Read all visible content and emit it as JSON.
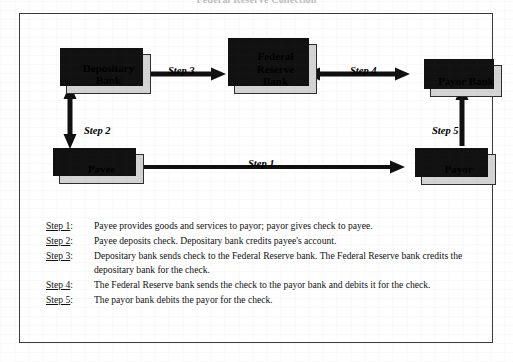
{
  "document": {
    "title": "Federal Reserve Collection"
  },
  "diagram": {
    "nodes": {
      "depositary_bank": "Depositary\nBank",
      "federal_reserve_bank": "Federal\nReserve\nBank",
      "payor_bank": "Payor Bank",
      "payee": "Payee",
      "payor": "Payor"
    },
    "arrow_labels": {
      "step1": "Step 1",
      "step2": "Step 2",
      "step3": "Step 3",
      "step4": "Step 4",
      "step5": "Step 5"
    }
  },
  "legend": {
    "items": [
      {
        "key": "Step 1",
        "colon": ":",
        "text": "Payee provides goods and services to payor; payor gives check to payee."
      },
      {
        "key": "Step 2",
        "colon": ":",
        "text": "Payee deposits check.  Depositary bank credits payee's account."
      },
      {
        "key": "Step 3",
        "colon": ":",
        "text": "Depositary bank sends check to the Federal Reserve bank.  The Federal Reserve bank credits the depositary bank for the check."
      },
      {
        "key": "Step 4",
        "colon": ":",
        "text": "The Federal Reserve bank sends the check to the payor bank and debits it for the check."
      },
      {
        "key": "Step 5",
        "colon": ":",
        "text": "The payor bank debits the payor for the check."
      }
    ]
  },
  "colors": {
    "box_fill": "#d4d4d4",
    "box_border": "#2e2e2e",
    "shadow": "#111111",
    "frame_border": "#3b3b3b",
    "text": "#111111",
    "page_background": "#ffffff"
  }
}
